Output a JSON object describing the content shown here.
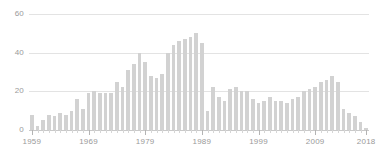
{
  "chart_data": {
    "type": "bar",
    "title": "",
    "subtitle": "",
    "xlabel": "",
    "ylabel": "",
    "grid": true,
    "legend": null,
    "xlim": [
      1959,
      2018
    ],
    "ylim": [
      0,
      60
    ],
    "y_ticks": [
      0,
      20,
      40,
      60
    ],
    "y_tick_labels": [
      "0",
      "20",
      "40",
      "60"
    ],
    "x_tick_labels": [
      "1959",
      "1969",
      "1979",
      "1989",
      "1999",
      "2009",
      "2018"
    ],
    "x_tick_values": [
      1959,
      1969,
      1979,
      1989,
      1999,
      2009,
      2018
    ],
    "bar_color": "#d2d2d2",
    "gridline_color": "#e3e3e3",
    "axis_color": "#c9c9c9",
    "text_color": "#9a9a9a",
    "categories": [
      1959,
      1960,
      1961,
      1962,
      1963,
      1964,
      1965,
      1966,
      1967,
      1968,
      1969,
      1970,
      1971,
      1972,
      1973,
      1974,
      1975,
      1976,
      1977,
      1978,
      1979,
      1980,
      1981,
      1982,
      1983,
      1984,
      1985,
      1986,
      1987,
      1988,
      1989,
      1990,
      1991,
      1992,
      1993,
      1994,
      1995,
      1996,
      1997,
      1998,
      1999,
      2000,
      2001,
      2002,
      2003,
      2004,
      2005,
      2006,
      2007,
      2008,
      2009,
      2010,
      2011,
      2012,
      2013,
      2014,
      2015,
      2016,
      2017,
      2018
    ],
    "values": [
      8,
      2,
      5,
      8,
      7,
      9,
      8,
      10,
      16,
      11,
      19,
      20,
      19,
      19,
      19,
      25,
      22,
      31,
      34,
      40,
      35,
      28,
      27,
      29,
      40,
      44,
      46,
      47,
      48,
      50,
      45,
      10,
      22,
      17,
      15,
      21,
      22,
      20,
      20,
      16,
      14,
      15,
      17,
      15,
      15,
      14,
      16,
      17,
      20,
      21,
      22,
      25,
      26,
      28,
      25,
      11,
      9,
      7,
      4,
      1
    ]
  }
}
